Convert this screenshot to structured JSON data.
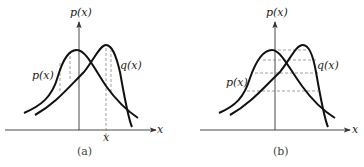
{
  "panels": [
    {
      "id": "a",
      "caption": "(a)",
      "y_axis_label": "p(x)",
      "x_axis_label": "x",
      "curve_labels": {
        "p": "p(x)",
        "q": "q(x)"
      },
      "x_tick_label": "x",
      "guides": "vertical dashed lines"
    },
    {
      "id": "b",
      "caption": "(b)",
      "y_axis_label": "p(x)",
      "x_axis_label": "x",
      "curve_labels": {
        "p": "p(x)",
        "q": "q(x)"
      },
      "guides": "horizontal dashed lines"
    }
  ]
}
